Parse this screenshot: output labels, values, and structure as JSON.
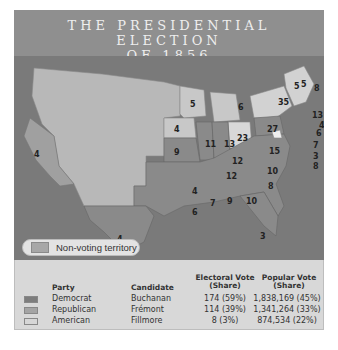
{
  "title": {
    "line1": "THE PRESIDENTIAL ELECTION",
    "line2": "OF 1856"
  },
  "colors": {
    "democrat": "#7d7d7d",
    "republican": "#a4a4a4",
    "american": "#d6d6d6",
    "non_voting": "#a7a7a7",
    "water": "#7a7a7a",
    "title_bg": "#8f8f8f"
  },
  "map": {
    "non_voting_label": "Non-voting territory",
    "state_votes": [
      {
        "state": "California",
        "votes": "4"
      },
      {
        "state": "Texas",
        "votes": "4"
      },
      {
        "state": "Iowa",
        "votes": "4"
      },
      {
        "state": "Wisconsin",
        "votes": "5"
      },
      {
        "state": "Michigan",
        "votes": "6"
      },
      {
        "state": "Missouri",
        "votes": "9"
      },
      {
        "state": "Illinois",
        "votes": "11"
      },
      {
        "state": "Indiana",
        "votes": "13"
      },
      {
        "state": "Ohio",
        "votes": "23"
      },
      {
        "state": "Pennsylvania",
        "votes": "27"
      },
      {
        "state": "New York",
        "votes": "35"
      },
      {
        "state": "Vermont",
        "votes": "5"
      },
      {
        "state": "New Hampshire",
        "votes": "5"
      },
      {
        "state": "Maine",
        "votes": "8"
      },
      {
        "state": "Massachusetts",
        "votes": "13"
      },
      {
        "state": "Rhode Island",
        "votes": "4"
      },
      {
        "state": "Connecticut",
        "votes": "6"
      },
      {
        "state": "New Jersey",
        "votes": "7"
      },
      {
        "state": "Delaware",
        "votes": "3"
      },
      {
        "state": "Maryland",
        "votes": "8"
      },
      {
        "state": "Virginia",
        "votes": "15"
      },
      {
        "state": "Kentucky",
        "votes": "12"
      },
      {
        "state": "Tennessee",
        "votes": "12"
      },
      {
        "state": "North Carolina",
        "votes": "10"
      },
      {
        "state": "South Carolina",
        "votes": "8"
      },
      {
        "state": "Arkansas",
        "votes": "4"
      },
      {
        "state": "Louisiana",
        "votes": "6"
      },
      {
        "state": "Mississippi",
        "votes": "7"
      },
      {
        "state": "Alabama",
        "votes": "9"
      },
      {
        "state": "Georgia",
        "votes": "10"
      },
      {
        "state": "Florida",
        "votes": "3"
      }
    ]
  },
  "legend": {
    "headers": {
      "party": "Party",
      "candidate": "Candidate",
      "electoral_1": "Electoral Vote",
      "electoral_2": "(Share)",
      "popular_1": "Popular Vote",
      "popular_2": "(Share)"
    },
    "rows": [
      {
        "party": "Democrat",
        "candidate": "Buchanan",
        "electoral": "174 (59%)",
        "popular": "1,838,169 (45%)"
      },
      {
        "party": "Republican",
        "candidate": "Frémont",
        "electoral": "114 (39%)",
        "popular": "1,341,264 (33%)"
      },
      {
        "party": "American",
        "candidate": "Fillmore",
        "electoral": "8 (3%)",
        "popular": "874,534 (22%)"
      }
    ]
  }
}
